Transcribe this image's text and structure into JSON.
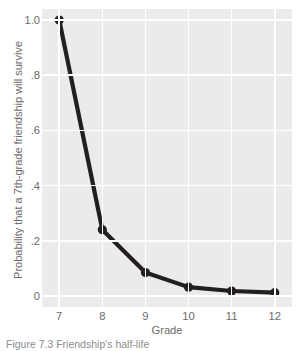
{
  "chart_data": {
    "type": "line",
    "title": "",
    "xlabel": "Grade",
    "ylabel": "Probability that a 7th-grade friendship will survive",
    "x": [
      7,
      8,
      9,
      10,
      11,
      12
    ],
    "values": [
      1.0,
      0.24,
      0.085,
      0.032,
      0.018,
      0.012
    ],
    "categories": [
      "7",
      "8",
      "9",
      "10",
      "11",
      "12"
    ],
    "xtick_labels": [
      "7",
      "8",
      "9",
      "10",
      "11",
      "12"
    ],
    "ytick_labels": [
      "1.0",
      ".8",
      ".6",
      ".4",
      ".2",
      "0"
    ],
    "ytick_values": [
      1.0,
      0.8,
      0.6,
      0.4,
      0.2,
      0.0
    ],
    "xlim": [
      6.6,
      12.4
    ],
    "ylim": [
      -0.04,
      1.04
    ],
    "grid": true,
    "legend": "none",
    "series": [
      {
        "name": "Probability of survival",
        "values": [
          1.0,
          0.24,
          0.085,
          0.032,
          0.018,
          0.012
        ]
      }
    ],
    "colors": {
      "line": "#231f20",
      "marker": "#231f20",
      "panel_background": "#ebebeb",
      "gridline": "#ffffff",
      "text": "#6b6b6b",
      "figure_background": "#ffffff"
    },
    "line_width": 4.2,
    "marker_size": 4.6
  },
  "caption": {
    "text": "Figure 7.3   Friendship's half-life"
  }
}
